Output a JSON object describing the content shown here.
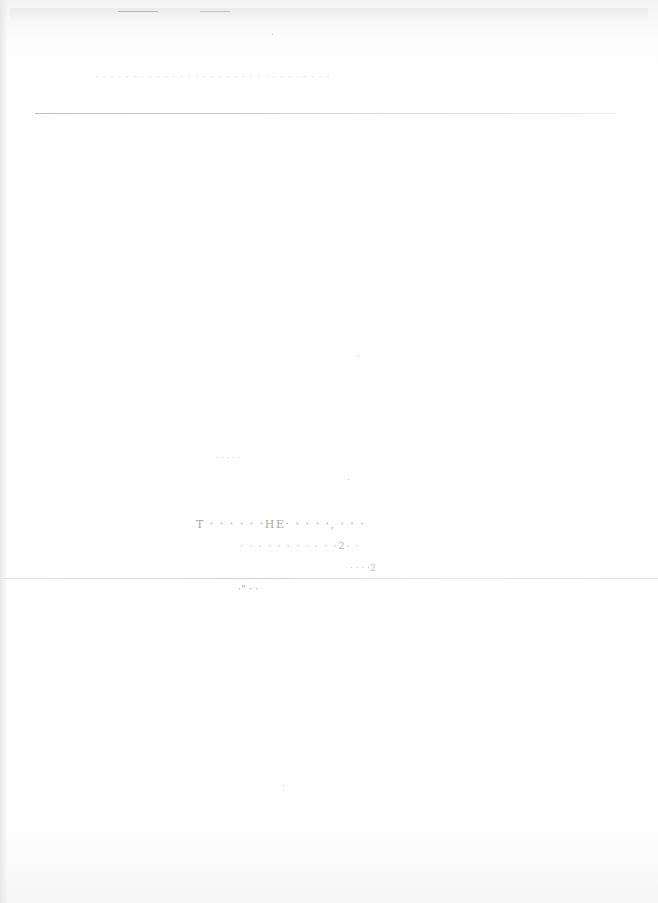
{
  "document": {
    "type": "scanned page (faded, largely illegible)",
    "header": {
      "text": "· · · · · · · · · · · · · · · · · · · · · · · · · · · · · · ·"
    },
    "body": {
      "line_1": "· ·   · · ·",
      "line_2": "T · · · · · ·HE· · · · ·, ·  · ·",
      "line_3": "· · ·  · · · · · · · ·2· ·",
      "line_4": "· · · ·2",
      "line_5": "·\" · ·"
    }
  }
}
